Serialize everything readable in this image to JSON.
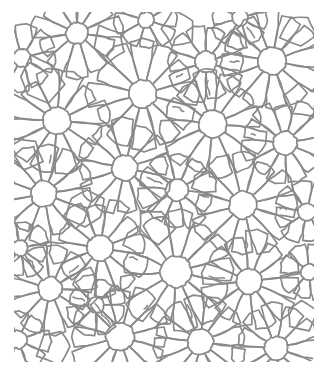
{
  "image": {
    "kind": "scanned-line-drawing",
    "title": "Radial daisy tessellation pattern",
    "description": "Hand-drawn pencil network of circular hubs with radiating spokes forming petal-shaped cells filling the plane",
    "width": 330,
    "height": 380,
    "background_color": "#ffffff",
    "ink_color": "#8a8a8a",
    "ink_color_dark": "#6f6f6f",
    "ink_color_light": "#a8a8a8",
    "stroke_width": 1.7,
    "drawing_bounds": {
      "x": 14,
      "y": 12,
      "width": 300,
      "height": 350
    },
    "has_text": false,
    "has_border": false
  },
  "pattern": {
    "type": "voronoi-daisy-network",
    "hub_count": 26,
    "hub_fill": "#ffffff",
    "petal_shape": "rounded-teardrop",
    "hubs": [
      {
        "cx": 77,
        "cy": 33,
        "r": 11,
        "petals": 11,
        "petal_len": 30,
        "rot": 8
      },
      {
        "cx": 143,
        "cy": 94,
        "r": 14,
        "petals": 12,
        "petal_len": 37,
        "rot": 14
      },
      {
        "cx": 57,
        "cy": 121,
        "r": 14,
        "petals": 12,
        "petal_len": 35,
        "rot": 4
      },
      {
        "cx": 206,
        "cy": 62,
        "r": 11,
        "petals": 10,
        "petal_len": 27,
        "rot": 18
      },
      {
        "cx": 272,
        "cy": 61,
        "r": 14,
        "petals": 12,
        "petal_len": 34,
        "rot": 10
      },
      {
        "cx": 213,
        "cy": 124,
        "r": 14,
        "petals": 12,
        "petal_len": 36,
        "rot": 6
      },
      {
        "cx": 285,
        "cy": 143,
        "r": 12,
        "petals": 11,
        "petal_len": 28,
        "rot": 22
      },
      {
        "cx": 125,
        "cy": 168,
        "r": 13,
        "petals": 12,
        "petal_len": 33,
        "rot": 12
      },
      {
        "cx": 44,
        "cy": 194,
        "r": 13,
        "petals": 12,
        "petal_len": 32,
        "rot": 20
      },
      {
        "cx": 177,
        "cy": 190,
        "r": 11,
        "petals": 10,
        "petal_len": 26,
        "rot": 5
      },
      {
        "cx": 243,
        "cy": 205,
        "r": 14,
        "petals": 12,
        "petal_len": 36,
        "rot": 16
      },
      {
        "cx": 100,
        "cy": 248,
        "r": 13,
        "petals": 12,
        "petal_len": 32,
        "rot": 9
      },
      {
        "cx": 176,
        "cy": 272,
        "r": 16,
        "petals": 13,
        "petal_len": 40,
        "rot": 11
      },
      {
        "cx": 249,
        "cy": 281,
        "r": 13,
        "petals": 12,
        "petal_len": 33,
        "rot": 24
      },
      {
        "cx": 50,
        "cy": 289,
        "r": 12,
        "petals": 11,
        "petal_len": 30,
        "rot": 2
      },
      {
        "cx": 120,
        "cy": 337,
        "r": 14,
        "petals": 12,
        "petal_len": 34,
        "rot": 15
      },
      {
        "cx": 200,
        "cy": 342,
        "r": 13,
        "petals": 12,
        "petal_len": 32,
        "rot": 7
      },
      {
        "cx": 276,
        "cy": 348,
        "r": 12,
        "petals": 11,
        "petal_len": 29,
        "rot": 19
      },
      {
        "cx": 22,
        "cy": 58,
        "r": 9,
        "petals": 8,
        "petal_len": 24,
        "rot": 30
      },
      {
        "cx": 307,
        "cy": 212,
        "r": 9,
        "petals": 8,
        "petal_len": 22,
        "rot": 12
      },
      {
        "cx": 18,
        "cy": 340,
        "r": 9,
        "petals": 8,
        "petal_len": 22,
        "rot": 25
      },
      {
        "cx": 309,
        "cy": 272,
        "r": 8,
        "petals": 8,
        "petal_len": 20,
        "rot": 40
      },
      {
        "cx": 146,
        "cy": 20,
        "r": 8,
        "petals": 8,
        "petal_len": 22,
        "rot": 16
      },
      {
        "cx": 240,
        "cy": 18,
        "r": 8,
        "petals": 8,
        "petal_len": 20,
        "rot": 28
      },
      {
        "cx": 20,
        "cy": 248,
        "r": 8,
        "petals": 8,
        "petal_len": 20,
        "rot": 35
      },
      {
        "cx": 96,
        "cy": 305,
        "r": 8,
        "petals": 8,
        "petal_len": 20,
        "rot": 44
      }
    ],
    "filler_cells": [
      {
        "cx": 40,
        "cy": 80,
        "r": 22,
        "sides": 6,
        "rot": 10
      },
      {
        "cx": 110,
        "cy": 45,
        "r": 20,
        "sides": 5,
        "rot": 25
      },
      {
        "cx": 178,
        "cy": 30,
        "r": 18,
        "sides": 5,
        "rot": 40
      },
      {
        "cx": 300,
        "cy": 30,
        "r": 18,
        "sides": 5,
        "rot": 15
      },
      {
        "cx": 86,
        "cy": 208,
        "r": 20,
        "sides": 6,
        "rot": 33
      },
      {
        "cx": 155,
        "cy": 225,
        "r": 18,
        "sides": 5,
        "rot": 8
      },
      {
        "cx": 300,
        "cy": 100,
        "r": 18,
        "sides": 5,
        "rot": 50
      },
      {
        "cx": 25,
        "cy": 155,
        "r": 18,
        "sides": 5,
        "rot": 20
      },
      {
        "cx": 55,
        "cy": 345,
        "r": 18,
        "sides": 5,
        "rot": 5
      },
      {
        "cx": 300,
        "cy": 315,
        "r": 16,
        "sides": 5,
        "rot": 60
      }
    ]
  },
  "render": {
    "seed": 20240517,
    "jitter": 1.6,
    "wobble_segments": 5
  }
}
